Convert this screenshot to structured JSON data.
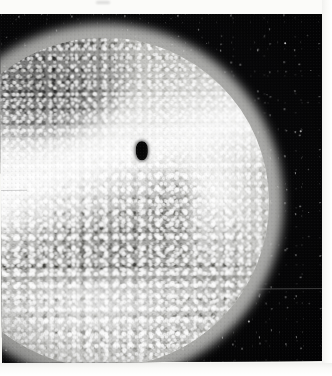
{
  "document": {
    "kind": "photographic-print",
    "medium": "black-and-white-halftone",
    "subject": "illuminated-sphere",
    "caption": ""
  },
  "canvas": {
    "width_px": 332,
    "height_px": 376,
    "paper_color": "#fbfbf9"
  },
  "print": {
    "left_px": 0,
    "top_px": 14,
    "width_px": 322,
    "height_px": 349,
    "background_color": "#050506",
    "rotation_deg": -0.35,
    "margins": {
      "top_px": 14,
      "right_px": 10,
      "bottom_px": 13,
      "left_px": 0
    }
  },
  "sphere": {
    "label": "sphere",
    "center_x_px": 103,
    "center_y_px": 203,
    "radius_px": 165,
    "base_color": "#cfcfcc",
    "limb_color": "#5a5a58",
    "surface": "mottled-granular",
    "cropped_at_left_edge": true
  },
  "features": [
    {
      "name": "bright-illumination-band",
      "description": "broad near-white diagonal swath across the upper-left hemisphere",
      "angle_deg": -17
    },
    {
      "name": "bright-shoulder-wash",
      "description": "diffuse highlight on the upper-left shoulder"
    },
    {
      "name": "right-limb-flare",
      "description": "bright jet-like flare on the right limb",
      "x_px": 228,
      "y_px": 160
    },
    {
      "name": "lower-limb-highlight",
      "description": "bright rim along the lower limb"
    },
    {
      "name": "grey-mottled-region",
      "description": "darker grey granular field covering the lower and right portion of the disc"
    },
    {
      "name": "upper-left-shadow-wedge",
      "description": "dark terminator shading along the upper-left limb"
    }
  ],
  "aperture": {
    "label": "dark-central-aperture",
    "x_px": 135,
    "y_px": 142,
    "width_px": 12,
    "height_px": 19,
    "shape": "vertical-oval",
    "color": "#050505"
  },
  "background": {
    "label": "dark-field",
    "color": "#050506",
    "speckles": "sparse-white-emulsion-specks"
  },
  "stars": [
    {
      "x_px": 284,
      "y_px": 44,
      "size_px": 2.0,
      "opacity": 0.85
    },
    {
      "x_px": 310,
      "y_px": 72,
      "size_px": 1.4,
      "opacity": 0.6
    },
    {
      "x_px": 266,
      "y_px": 96,
      "size_px": 1.2,
      "opacity": 0.55
    },
    {
      "x_px": 299,
      "y_px": 132,
      "size_px": 1.5,
      "opacity": 0.65
    },
    {
      "x_px": 276,
      "y_px": 188,
      "size_px": 1.3,
      "opacity": 0.58
    },
    {
      "x_px": 307,
      "y_px": 214,
      "size_px": 1.1,
      "opacity": 0.5
    },
    {
      "x_px": 261,
      "y_px": 246,
      "size_px": 1.4,
      "opacity": 0.62
    },
    {
      "x_px": 292,
      "y_px": 300,
      "size_px": 1.2,
      "opacity": 0.54
    },
    {
      "x_px": 246,
      "y_px": 322,
      "size_px": 1.5,
      "opacity": 0.66
    },
    {
      "x_px": 150,
      "y_px": 336,
      "size_px": 1.3,
      "opacity": 0.57
    },
    {
      "x_px": 74,
      "y_px": 318,
      "size_px": 1.4,
      "opacity": 0.6
    },
    {
      "x_px": 36,
      "y_px": 338,
      "size_px": 1.2,
      "opacity": 0.52
    },
    {
      "x_px": 206,
      "y_px": 44,
      "size_px": 1.1,
      "opacity": 0.45
    },
    {
      "x_px": 122,
      "y_px": 30,
      "size_px": 1.0,
      "opacity": 0.42
    },
    {
      "x_px": 318,
      "y_px": 258,
      "size_px": 1.3,
      "opacity": 0.56
    }
  ],
  "defects": [
    {
      "name": "horizontal-scratch",
      "x_px": 222,
      "y_px": 290,
      "length_px": 108
    },
    {
      "name": "left-edge-scuff",
      "x_px": 0,
      "y_px": 190,
      "length_px": 26
    },
    {
      "name": "paper-mark-top",
      "x_px": 96,
      "y_px": 1
    }
  ],
  "paper_marks": {
    "bottom_right_glyph": ""
  }
}
